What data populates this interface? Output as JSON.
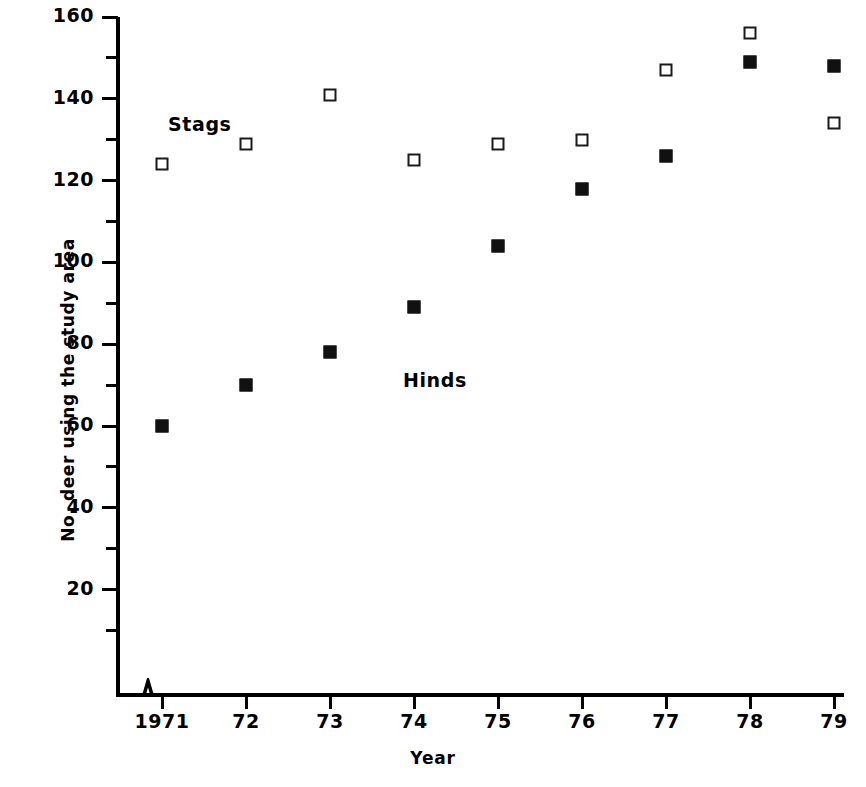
{
  "chart_data": {
    "type": "scatter",
    "title": "",
    "xlabel": "Year",
    "ylabel": "No. deer using the study area",
    "x": [
      1971,
      1972,
      1973,
      1974,
      1975,
      1976,
      1977,
      1978,
      1979
    ],
    "xtick_labels": [
      "1971",
      "72",
      "73",
      "74",
      "75",
      "76",
      "77",
      "78",
      "79"
    ],
    "ytick_labels": [
      "160",
      "140",
      "120",
      "100",
      "80",
      "60",
      "40",
      "20"
    ],
    "ytick_values": [
      160,
      140,
      120,
      100,
      80,
      60,
      40,
      20
    ],
    "yminor_values": [
      150,
      130,
      110,
      90,
      70,
      50,
      30,
      10
    ],
    "ylim": [
      0,
      160
    ],
    "grid": false,
    "axis_break_x": true,
    "legend": "inline-annotations",
    "series": [
      {
        "name": "Stags",
        "marker": "open-square",
        "values": [
          124,
          129,
          141,
          125,
          129,
          130,
          147,
          156,
          134
        ]
      },
      {
        "name": "Hinds",
        "marker": "filled-square",
        "values": [
          60,
          70,
          78,
          89,
          104,
          118,
          126,
          149,
          148
        ]
      }
    ],
    "annotations": [
      {
        "text": "Stags",
        "x_px": 168,
        "y_px": 113
      },
      {
        "text": "Hinds",
        "x_px": 403,
        "y_px": 369
      }
    ]
  }
}
